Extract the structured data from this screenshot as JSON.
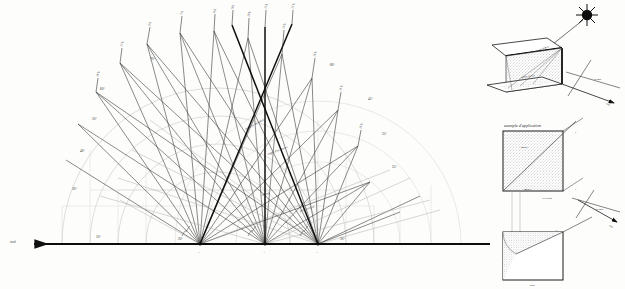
{
  "plate": {
    "title": "Diagramme solaire - abaque des trajectoires du soleil",
    "language": "fr",
    "background_color": "#fdfdfc",
    "ink_color": "#1a1a1a",
    "faint_ink_color": "#b9b9b9",
    "mid_ink_color": "#6e6e6e"
  },
  "main_diagram": {
    "name": "sun-path-protractor",
    "baseline": {
      "left_arrow_label": "nord",
      "right_extent_label": "",
      "angle_ticks": [
        "10°",
        "20°",
        "30°"
      ]
    },
    "vertices": [
      {
        "id": "A1",
        "label": "A",
        "x": 200,
        "y": 244
      },
      {
        "id": "A2",
        "label": "A",
        "x": 265,
        "y": 244
      },
      {
        "id": "A3",
        "label": "A",
        "x": 318,
        "y": 244
      }
    ],
    "arc_degree_labels": [
      "10°",
      "20°",
      "30°",
      "40°",
      "50°",
      "60°",
      "70°",
      "80°",
      "90°",
      "45°",
      "35°",
      "25°",
      "15°"
    ],
    "hour_labels_top": [
      "6 h",
      "7 h",
      "8 h",
      "9 h",
      "10 h",
      "11 h",
      "12 h",
      "13 h",
      "14 h",
      "15 h",
      "16 h",
      "17 h",
      "18 h"
    ],
    "annotations": [
      "hauteur du soleil",
      "angle d'incidence",
      "azimut",
      "plan vertical"
    ]
  },
  "inset_top": {
    "name": "overhang-isometric",
    "sun_label": "soleil",
    "azimuth_label": "azimut",
    "south_label": "sud",
    "ray_label": "rayon solaire",
    "shadow_label": "ombre portée"
  },
  "inset_middle": {
    "name": "application-elevation",
    "caption": "exemple d'application",
    "inner_label": "ombre",
    "bottom_label": "élévation",
    "edge_label": "F"
  },
  "inset_bottom": {
    "name": "application-plan",
    "caption": "plan",
    "azimuth_label": "azimut",
    "south_label": "sud",
    "edge_label": "F"
  }
}
